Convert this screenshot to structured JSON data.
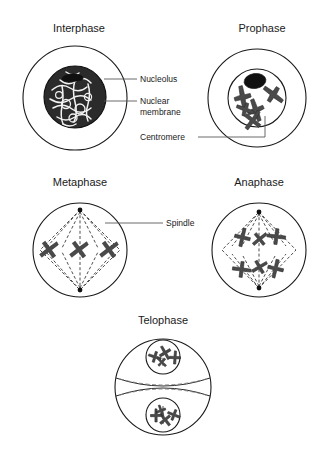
{
  "diagram": {
    "background_color": "#ffffff",
    "ink_color": "#1a1a1a",
    "accent_color": "#4a4a4a",
    "leader_color": "#5a5a5a"
  },
  "phases": [
    {
      "id": "interphase",
      "label": "Interphase",
      "title_x": 79,
      "title_y": 32,
      "cell_cx": 75,
      "cell_cy": 98,
      "cell_r": 52,
      "nucleus_cx": 75,
      "nucleus_cy": 97,
      "nucleus_r": 31,
      "description": "Cell with large dark nucleus filled with chromatin network and a nucleolus"
    },
    {
      "id": "prophase",
      "label": "Prophase",
      "title_x": 262,
      "title_y": 32,
      "cell_cx": 257,
      "cell_cy": 98,
      "cell_r": 49,
      "nucleus_cx": 257,
      "nucleus_cy": 98,
      "nucleus_r": 29,
      "description": "Nuclear membrane still present, chromosomes condensed, nucleolus visible"
    },
    {
      "id": "metaphase",
      "label": "Metaphase",
      "title_x": 80,
      "title_y": 186,
      "cell_cx": 80,
      "cell_cy": 250,
      "cell_r": 47,
      "description": "Chromosomes aligned on the equator, diamond spindle between two poles"
    },
    {
      "id": "anaphase",
      "label": "Anaphase",
      "title_x": 259,
      "title_y": 186,
      "cell_cx": 259,
      "cell_cy": 250,
      "cell_r": 47,
      "description": "Sister chromatids pulled apart toward opposite poles along spindle fibres"
    },
    {
      "id": "telophase",
      "label": "Telophase",
      "title_x": 163,
      "title_y": 324,
      "cell_cx": 163,
      "cell_cy": 387,
      "cell_r": 48,
      "description": "Two daughter nuclei reforming, cleavage furrow pinching the cell"
    }
  ],
  "callouts": [
    {
      "id": "nucleolus",
      "label": "Nucleolus",
      "text_x": 140,
      "text_y": 82,
      "leader": "M 104 79 L 137 79"
    },
    {
      "id": "nuclear-membrane",
      "label_line1": "Nuclear",
      "label_line2": "membrane",
      "text_x": 140,
      "text_y": 104,
      "text_y2": 114,
      "leader": "M 104 101 L 137 101"
    },
    {
      "id": "centromere",
      "label": "Centromere",
      "text_x": 140,
      "text_y": 140,
      "leader": "M 198 137 L 265 137 L 265 116"
    },
    {
      "id": "spindle",
      "label": "Spindle",
      "text_x": 166,
      "text_y": 226,
      "leader": "M 105 223 L 163 223"
    }
  ],
  "footer": {
    "mark": ""
  }
}
